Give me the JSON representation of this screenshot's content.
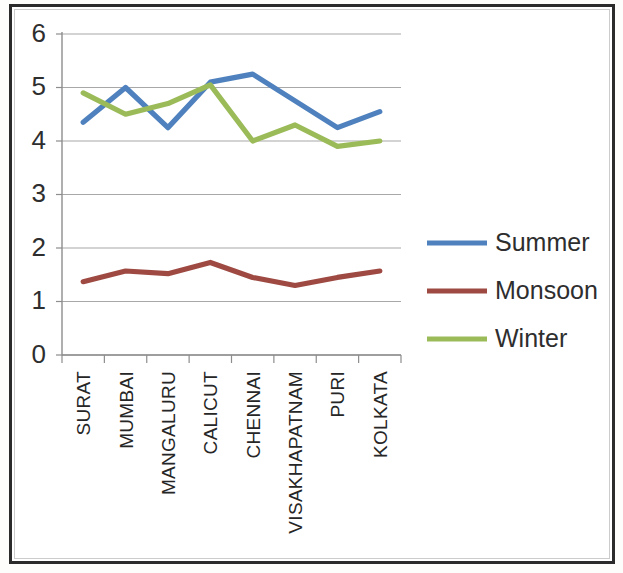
{
  "chart_data": {
    "type": "line",
    "title": "",
    "xlabel": "",
    "ylabel": "",
    "ylim": [
      0,
      6
    ],
    "ytick_values": [
      0,
      1,
      2,
      3,
      4,
      5,
      6
    ],
    "ytick_labels": [
      "0",
      "1",
      "2",
      "3",
      "4",
      "5",
      "6"
    ],
    "grid": true,
    "legend_position": "right",
    "categories": [
      "SURAT",
      "MUMBAI",
      "MANGALURU",
      "CALICUT",
      "CHENNAI",
      "VISAKHAPATNAM",
      "PURI",
      "KOLKATA"
    ],
    "series": [
      {
        "name": "Summer",
        "color": "#4e81bd",
        "values": [
          4.35,
          5.0,
          4.25,
          5.1,
          5.25,
          4.75,
          4.25,
          4.55
        ]
      },
      {
        "name": "Monsoon",
        "color": "#9e4a42",
        "values": [
          1.37,
          1.57,
          1.52,
          1.73,
          1.45,
          1.3,
          1.45,
          1.57
        ]
      },
      {
        "name": "Winter",
        "color": "#9bbb59",
        "values": [
          4.9,
          4.5,
          4.7,
          5.05,
          4.0,
          4.3,
          3.9,
          4.0
        ]
      }
    ]
  },
  "legend": {
    "entries": [
      {
        "label": "Summer",
        "color": "#4e81bd"
      },
      {
        "label": "Monsoon",
        "color": "#9e4a42"
      },
      {
        "label": "Winter",
        "color": "#9bbb59"
      }
    ]
  },
  "axes": {
    "y_axis_name": "value-axis",
    "x_axis_name": "category-axis"
  }
}
